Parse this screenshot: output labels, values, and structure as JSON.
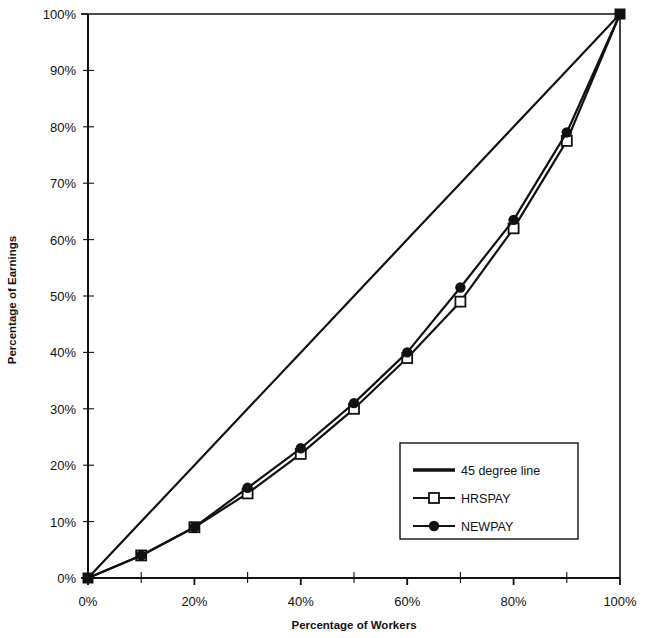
{
  "chart_data": {
    "type": "line",
    "title": "",
    "xlabel": "Percentage of Workers",
    "ylabel": "Percentage of Earnings",
    "xlim": [
      0,
      100
    ],
    "ylim": [
      0,
      100
    ],
    "grid": false,
    "legend_position": "inside-lower-right",
    "x_ticks": [
      "0%",
      "20%",
      "40%",
      "60%",
      "80%",
      "100%"
    ],
    "x_tick_values": [
      0,
      20,
      40,
      60,
      80,
      100
    ],
    "x_minor_tick_values": [
      10,
      30,
      50,
      70,
      90
    ],
    "y_ticks": [
      "0%",
      "10%",
      "20%",
      "30%",
      "40%",
      "50%",
      "60%",
      "70%",
      "80%",
      "90%",
      "100%"
    ],
    "y_tick_values": [
      0,
      10,
      20,
      30,
      40,
      50,
      60,
      70,
      80,
      90,
      100
    ],
    "x": [
      0,
      10,
      20,
      30,
      40,
      50,
      60,
      70,
      80,
      90,
      100
    ],
    "series": [
      {
        "name": "45 degree line",
        "marker": "none",
        "color": "#111111",
        "values": [
          0,
          10,
          20,
          30,
          40,
          50,
          60,
          70,
          80,
          90,
          100
        ]
      },
      {
        "name": "HRSPAY",
        "marker": "open-square",
        "color": "#111111",
        "values": [
          0,
          4,
          9,
          15,
          22,
          30,
          39,
          49,
          62,
          77.5,
          100
        ]
      },
      {
        "name": "NEWPAY",
        "marker": "filled-circle",
        "color": "#111111",
        "values": [
          0,
          4,
          9,
          16,
          23,
          31,
          40,
          51.5,
          63.5,
          79,
          100
        ]
      }
    ]
  },
  "legend": {
    "entries": [
      {
        "label": "45 degree line",
        "marker": "none"
      },
      {
        "label": "HRSPAY",
        "marker": "open-square"
      },
      {
        "label": "NEWPAY",
        "marker": "filled-circle"
      }
    ]
  },
  "colors": {
    "line": "#111111",
    "axis": "#111111",
    "background": "#ffffff"
  }
}
